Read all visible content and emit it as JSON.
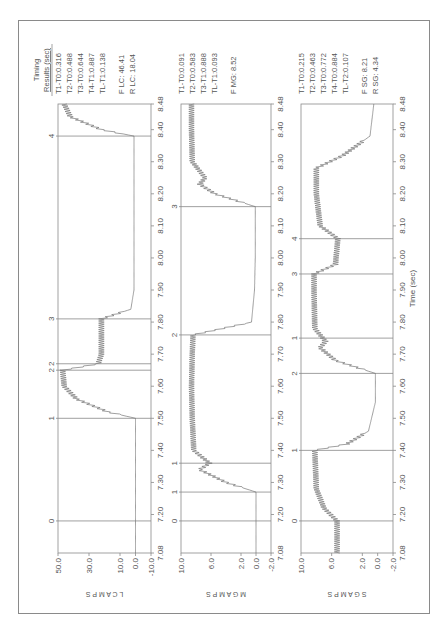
{
  "figure": {
    "orientation": "rotated-90-ccw",
    "frame_color": "#8a8a8a",
    "trace_color": "#777777",
    "marker_line_color": "#888888"
  },
  "results": {
    "header_line1": "Timing",
    "header_line2": "Results (sec)",
    "lc": [
      "T1-T0:0.316",
      "T2-T0:0.488",
      "T3-T0:0.644",
      "T4-T1:0.887",
      "TL-T1:0.138"
    ],
    "lc_extra": [
      "F LC: 46.41",
      "R LC: 18.04"
    ],
    "mg": [
      "T1-T0:0.091",
      "T2-T0:0.583",
      "T3-T1:0.888",
      "TL-T1:0.093"
    ],
    "mg_extra": [
      "F MG: 8.52"
    ],
    "sg": [
      "T1-T0:0.215",
      "T2-T0:0.463",
      "T3-T0:0.772",
      "T4-T0:0.884",
      "TL-T2:0.107"
    ],
    "sg_extra": [
      "F SG: 8.21",
      "R SG: 4.34"
    ]
  },
  "chart_data": [
    {
      "type": "line",
      "title": "LC AMPS",
      "ylabel": "L C   A M P S",
      "xlabel": "",
      "xlim": [
        7.08,
        8.48
      ],
      "ylim": [
        -10.0,
        50.0
      ],
      "yticks": [
        "50.0",
        "30.0",
        "10.0",
        "0.0",
        "-10.0"
      ],
      "xticks": [
        "7.08",
        "7.20",
        "7.30",
        "7.40",
        "7.50",
        "7.60",
        "7.70",
        "7.80",
        "7.90",
        "8.00",
        "8.10",
        "8.20",
        "8.30",
        "8.40",
        "8.48"
      ],
      "markers": [
        {
          "label": "0",
          "t": 7.18
        },
        {
          "label": "1",
          "t": 7.5
        },
        {
          "label": "2",
          "t": 7.67
        },
        {
          "label": "2",
          "t": 7.65
        },
        {
          "label": "3",
          "t": 7.81
        },
        {
          "label": "4",
          "t": 8.38
        }
      ],
      "x": [
        7.08,
        7.18,
        7.3,
        7.4,
        7.5,
        7.52,
        7.56,
        7.6,
        7.65,
        7.67,
        7.7,
        7.75,
        7.81,
        7.84,
        7.9,
        8.0,
        8.1,
        8.2,
        8.3,
        8.38,
        8.4,
        8.44,
        8.48
      ],
      "values": [
        0,
        0,
        0,
        0,
        0,
        18,
        38,
        46,
        47,
        24,
        22,
        22,
        22,
        3,
        1,
        1,
        1,
        1,
        1,
        1,
        22,
        42,
        46
      ]
    },
    {
      "type": "line",
      "title": "MG AMPS",
      "ylabel": "M G   A M P S",
      "xlabel": "",
      "xlim": [
        7.08,
        8.48
      ],
      "ylim": [
        -2.0,
        10.0
      ],
      "yticks": [
        "10.0",
        "6.0",
        "2.0",
        "0.0",
        "-2.0"
      ],
      "xticks": [
        "7.08",
        "7.20",
        "7.30",
        "7.40",
        "7.50",
        "7.60",
        "7.70",
        "7.80",
        "7.90",
        "8.00",
        "8.10",
        "8.20",
        "8.30",
        "8.40",
        "8.48"
      ],
      "markers": [
        {
          "label": "0",
          "t": 7.18
        },
        {
          "label": "1",
          "t": 7.27
        },
        {
          "label": "1",
          "t": 7.36
        },
        {
          "label": "2",
          "t": 7.76
        },
        {
          "label": "3",
          "t": 8.16
        }
      ],
      "x": [
        7.08,
        7.18,
        7.27,
        7.3,
        7.34,
        7.36,
        7.4,
        7.5,
        7.6,
        7.7,
        7.76,
        7.8,
        7.9,
        8.0,
        8.1,
        8.16,
        8.2,
        8.23,
        8.25,
        8.3,
        8.4,
        8.48
      ],
      "values": [
        0,
        0,
        0,
        4,
        7.5,
        6.2,
        8.3,
        8.5,
        8.6,
        8.5,
        8.4,
        0.6,
        0.2,
        0.1,
        0.1,
        0.1,
        5.5,
        7.5,
        6.8,
        8.5,
        8.6,
        8.6
      ]
    },
    {
      "type": "line",
      "title": "SG AMPS",
      "ylabel": "S G   A M P S",
      "xlabel": "Time (sec)",
      "xlim": [
        7.08,
        8.48
      ],
      "ylim": [
        -2.0,
        10.0
      ],
      "yticks": [
        "10.0",
        "6.0",
        "2.0",
        "0.0",
        "-2.0"
      ],
      "xticks": [
        "7.08",
        "7.20",
        "7.30",
        "7.40",
        "7.50",
        "7.60",
        "7.70",
        "7.80",
        "7.90",
        "8.00",
        "8.10",
        "8.20",
        "8.30",
        "8.40",
        "8.48"
      ],
      "markers": [
        {
          "label": "0",
          "t": 7.18
        },
        {
          "label": "1",
          "t": 7.4
        },
        {
          "label": "2",
          "t": 7.64
        },
        {
          "label": "1",
          "t": 7.75
        },
        {
          "label": "3",
          "t": 7.95
        },
        {
          "label": "4",
          "t": 8.06
        }
      ],
      "x": [
        7.08,
        7.18,
        7.22,
        7.28,
        7.4,
        7.42,
        7.46,
        7.55,
        7.64,
        7.68,
        7.72,
        7.74,
        7.78,
        7.9,
        7.95,
        7.98,
        8.06,
        8.1,
        8.2,
        8.28,
        8.32,
        8.38,
        8.48
      ],
      "values": [
        5.3,
        5.3,
        7.0,
        8.0,
        8.2,
        4.0,
        1.2,
        0.3,
        0.3,
        5.5,
        7.5,
        6.8,
        8.2,
        8.3,
        8.3,
        5.5,
        5.2,
        7.5,
        8.0,
        8.0,
        4.5,
        1.0,
        0.5
      ]
    }
  ]
}
